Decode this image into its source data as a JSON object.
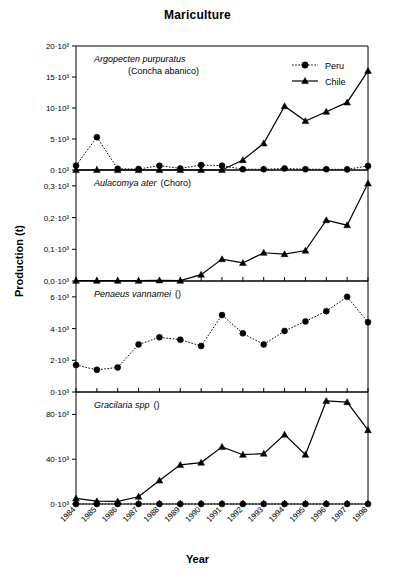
{
  "chart_data": {
    "type": "line",
    "title": "Mariculture",
    "xlabel": "Year",
    "ylabel": "Production (t)",
    "grid": false,
    "legend_position": "top-right of first panel",
    "legend": [
      {
        "name": "Peru",
        "marker": "circle",
        "line": "dotted"
      },
      {
        "name": "Chile",
        "marker": "triangle",
        "line": "solid"
      }
    ],
    "x": [
      1984,
      1985,
      1986,
      1987,
      1988,
      1989,
      1990,
      1991,
      1992,
      1993,
      1994,
      1995,
      1996,
      1997,
      1998
    ],
    "categories": [
      "1984",
      "1985",
      "1986",
      "1987",
      "1988",
      "1989",
      "1990",
      "1991",
      "1992",
      "1993",
      "1994",
      "1995",
      "1996",
      "1997",
      "1998"
    ],
    "panels": [
      {
        "id": "argopecten",
        "caption_species": "Argopecten purpuratus",
        "caption_common": "(Concha abanico)",
        "ylim": [
          0,
          20000
        ],
        "yticks": [
          0,
          5000,
          10000,
          15000,
          20000
        ],
        "yticklabels": [
          "0·10³",
          "5·10³",
          "10·10³",
          "15·10³",
          "20·10³"
        ],
        "series": [
          {
            "name": "Peru",
            "values": [
              700,
              5300,
              200,
              150,
              700,
              250,
              800,
              700,
              120,
              120,
              250,
              130,
              120,
              100,
              650
            ]
          },
          {
            "name": "Chile",
            "values": [
              0,
              0,
              0,
              0,
              0,
              0,
              0,
              0,
              1600,
              4300,
              10300,
              7900,
              9400,
              10900,
              16000
            ]
          }
        ]
      },
      {
        "id": "aulacomya",
        "caption_species": "Aulacomya ater",
        "caption_common": "(Choro)",
        "ylim": [
          0,
          350
        ],
        "yticks": [
          0,
          100,
          200,
          300
        ],
        "yticklabels": [
          "0,0·10³",
          "0,1·10³",
          "0,2·10³",
          "0,3·10³"
        ],
        "series": [
          {
            "name": "Chile",
            "values": [
              1,
              1,
              1,
              1,
              2,
              1,
              20,
              69,
              57,
              89,
              85,
              96,
              192,
              176,
              308
            ]
          }
        ]
      },
      {
        "id": "penaeus",
        "caption_species": "Penaeus vannamei",
        "caption_common": "()",
        "ylim": [
          0,
          7000
        ],
        "yticks": [
          0,
          2000,
          4000,
          6000
        ],
        "yticklabels": [
          "0·10³",
          "2·10³",
          "4·10³",
          "6·10³"
        ],
        "series": [
          {
            "name": "Peru",
            "values": [
              1700,
              1400,
              1550,
              3000,
              3450,
              3300,
              2900,
              4850,
              3700,
              3000,
              3850,
              4450,
              5100,
              6000,
              4400
            ]
          }
        ]
      },
      {
        "id": "gracilaria",
        "caption_species": "Gracilaria spp",
        "caption_common": "()",
        "ylim": [
          0,
          100000
        ],
        "yticks": [
          0,
          40000,
          80000
        ],
        "yticklabels": [
          "0·10³",
          "40·10³",
          "80·10³"
        ],
        "series": [
          {
            "name": "Peru",
            "values": [
              0,
              0,
              0,
              0,
              0,
              0,
              0,
              0,
              0,
              0,
              0,
              0,
              0,
              0,
              0
            ]
          },
          {
            "name": "Chile",
            "values": [
              5000,
              2500,
              2300,
              6500,
              21000,
              35000,
              37000,
              51000,
              44000,
              45000,
              62000,
              44000,
              92000,
              91000,
              66000
            ]
          }
        ]
      }
    ]
  }
}
